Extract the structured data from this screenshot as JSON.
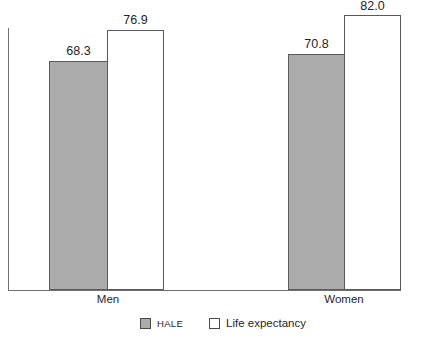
{
  "chart_data": {
    "type": "bar",
    "title": "",
    "subtitle": "",
    "xlabel": "",
    "ylabel": "",
    "categories": [
      "Men",
      "Women"
    ],
    "series": [
      {
        "name": "HALE",
        "values": [
          68.3,
          82.0
        ],
        "color": "#ababab"
      },
      {
        "name": "Life expectancy",
        "values": [
          76.9,
          82.0
        ],
        "color": "#ffffff"
      }
    ],
    "data_labels": {
      "men": {
        "hale": "68.3",
        "life_expectancy": "76.9"
      },
      "women": {
        "hale": "70.8",
        "life_expectancy": "82.0"
      }
    },
    "values_flat": [
      68.3,
      76.9,
      70.8,
      82.0
    ],
    "ylim": [
      0,
      86
    ],
    "grid": false,
    "legend_position": "bottom-center",
    "axis_lines": [
      "left",
      "bottom",
      "right"
    ],
    "bar_outline_color": "#5a5a5a"
  },
  "labels": {
    "men": "Men",
    "women": "Women",
    "men_hale_value": "68.3",
    "men_life_value": "76.9",
    "women_hale_value": "70.8",
    "women_life_value": "82.0"
  },
  "legend": {
    "hale_label": "HALE",
    "life_label": "Life expectancy"
  },
  "colors": {
    "hale_fill": "#ababab",
    "life_fill": "#ffffff",
    "outline": "#5a5a5a",
    "axis": "#6f6f6f",
    "text": "#262626"
  }
}
